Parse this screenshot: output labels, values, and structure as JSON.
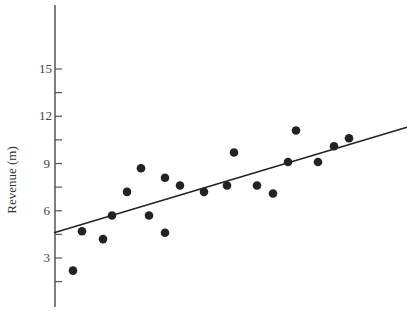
{
  "chart_data": {
    "type": "scatter",
    "title": "",
    "xlabel": "",
    "ylabel": "Revenue (m)",
    "ylim": [
      0,
      19
    ],
    "yticks": [
      3,
      6,
      9,
      12,
      15
    ],
    "yticks_minor": [
      1.5,
      4.5,
      7.5,
      10.5,
      13.5
    ],
    "grid": false,
    "legend": null,
    "x_axis_visible": false,
    "series": [
      {
        "name": "observations",
        "type": "scatter",
        "color": "#222222",
        "points": [
          {
            "x": 73,
            "y": 2.2
          },
          {
            "x": 82,
            "y": 4.7
          },
          {
            "x": 103,
            "y": 4.2
          },
          {
            "x": 112,
            "y": 5.7
          },
          {
            "x": 127,
            "y": 7.2
          },
          {
            "x": 141,
            "y": 8.7
          },
          {
            "x": 149,
            "y": 5.7
          },
          {
            "x": 165,
            "y": 8.1
          },
          {
            "x": 165,
            "y": 4.6
          },
          {
            "x": 180,
            "y": 7.6
          },
          {
            "x": 204,
            "y": 7.2
          },
          {
            "x": 227,
            "y": 7.6
          },
          {
            "x": 234,
            "y": 9.7
          },
          {
            "x": 257,
            "y": 7.6
          },
          {
            "x": 273,
            "y": 7.1
          },
          {
            "x": 288,
            "y": 9.1
          },
          {
            "x": 296,
            "y": 11.1
          },
          {
            "x": 318,
            "y": 9.1
          },
          {
            "x": 334,
            "y": 10.1
          },
          {
            "x": 349,
            "y": 10.6
          }
        ]
      },
      {
        "name": "trend line",
        "type": "line",
        "color": "#222222",
        "points": [
          {
            "x": 54,
            "y": 4.6
          },
          {
            "x": 407,
            "y": 11.3
          }
        ]
      }
    ]
  },
  "labels": {
    "ylabel": "Revenue (m)",
    "ytick_15": "15",
    "ytick_12": "12",
    "ytick_9": "9",
    "ytick_6": "6",
    "ytick_3": "3"
  },
  "colors": {
    "axis": "#555555",
    "points": "#222222",
    "line": "#222222"
  }
}
